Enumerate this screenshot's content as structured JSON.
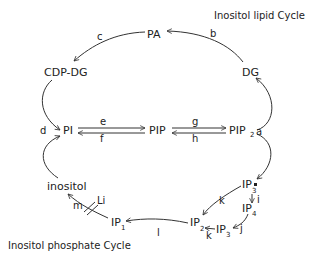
{
  "titles": {
    "lipid_cycle": "Inositol lipid Cycle",
    "phosphate_cycle": "Inositol phosphate Cycle"
  },
  "nodes": {
    "PA": "PA",
    "CDP_DG": "CDP-DG",
    "DG": "DG",
    "PI": "PI",
    "PIP": "PIP",
    "PIP2": "PIP",
    "PIP2_sub": "2",
    "IP3a": "IP",
    "IP3a_sub": "3",
    "IP3a_mark": "*",
    "IP4": "IP",
    "IP4_sub": "4",
    "IP3b": "IP",
    "IP3b_sub": "3",
    "IP2": "IP",
    "IP2_sub": "2",
    "IP1": "IP",
    "IP1_sub": "1",
    "inositol": "inositol"
  },
  "edges": {
    "a": "a",
    "b": "b",
    "c": "c",
    "d": "d",
    "e": "e",
    "f": "f",
    "g": "g",
    "h": "h",
    "i": "i",
    "j": "j",
    "k1": "k",
    "k2": "k",
    "l": "l",
    "m": "m"
  },
  "inhibitor": {
    "label": "Li"
  }
}
